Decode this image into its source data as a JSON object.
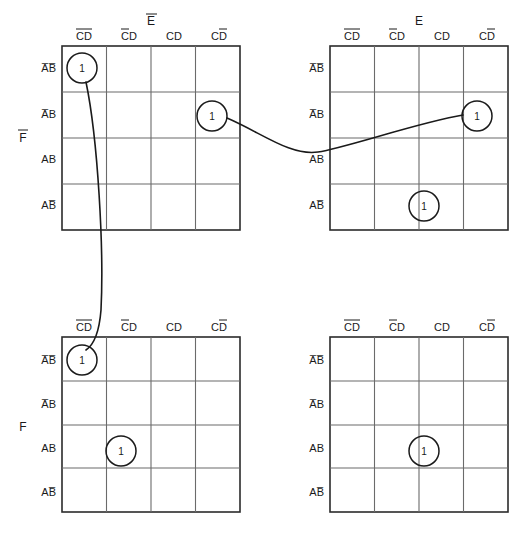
{
  "figure": {
    "name": "five-variable-karnaugh-map-set",
    "background_color": "#ffffff",
    "line_color": "#3c3c3c",
    "text_color": "#1a1a1a"
  },
  "column_headers": [
    "CD",
    "CD",
    "CD",
    "CD"
  ],
  "column_headers_display": [
    "C̅D̅",
    "C̅D",
    "CD",
    "CD̅"
  ],
  "column_overbars": [
    {
      "C": true,
      "D": true
    },
    {
      "C": true,
      "D": false
    },
    {
      "C": false,
      "D": false
    },
    {
      "C": false,
      "D": true
    }
  ],
  "row_headers_display": [
    "A̅B̅",
    "A̅B",
    "AB",
    "AB̅"
  ],
  "row_overbars": [
    {
      "A": true,
      "B": true
    },
    {
      "A": true,
      "B": false
    },
    {
      "A": false,
      "B": false
    },
    {
      "A": false,
      "B": true
    }
  ],
  "group_labels": {
    "top_row_left": "F",
    "top_row_left_overbar": true,
    "bottom_row_left": "F",
    "bottom_row_left_overbar": false
  },
  "maps": [
    {
      "id": "map-top-left",
      "title": "E",
      "title_overbar": true,
      "position": "top-left",
      "ones": [
        {
          "row": 0,
          "col": 0,
          "value": "1",
          "row_label": "A̅B̅",
          "col_label": "C̅D̅"
        },
        {
          "row": 1,
          "col": 3,
          "value": "1",
          "row_label": "A̅B",
          "col_label": "CD̅"
        }
      ]
    },
    {
      "id": "map-top-right",
      "title": "E",
      "title_overbar": false,
      "position": "top-right",
      "ones": [
        {
          "row": 1,
          "col": 3,
          "value": "1",
          "row_label": "A̅B",
          "col_label": "CD̅"
        },
        {
          "row": 3,
          "col": 2,
          "value": "1",
          "row_label": "AB̅",
          "col_label": "CD"
        }
      ]
    },
    {
      "id": "map-bottom-left",
      "title": "",
      "title_overbar": false,
      "position": "bottom-left",
      "ones": [
        {
          "row": 0,
          "col": 0,
          "value": "1",
          "row_label": "A̅B̅",
          "col_label": "C̅D̅"
        },
        {
          "row": 2,
          "col": 1,
          "value": "1",
          "row_label": "AB",
          "col_label": "C̅D"
        }
      ]
    },
    {
      "id": "map-bottom-right",
      "title": "",
      "title_overbar": false,
      "position": "bottom-right",
      "ones": [
        {
          "row": 2,
          "col": 2,
          "value": "1",
          "row_label": "AB",
          "col_label": "CD"
        }
      ]
    }
  ],
  "connections": [
    {
      "id": "link-horizontal",
      "from_map": "map-top-left",
      "from_cell": "A̅B/CD̅",
      "to_map": "map-top-right",
      "to_cell": "A̅B/CD̅",
      "style": "curve-dip"
    },
    {
      "id": "link-vertical",
      "from_map": "map-top-left",
      "from_cell": "A̅B̅/C̅D̅",
      "to_map": "map-bottom-left",
      "to_cell": "A̅B̅/C̅D̅",
      "style": "curve-bow"
    }
  ]
}
